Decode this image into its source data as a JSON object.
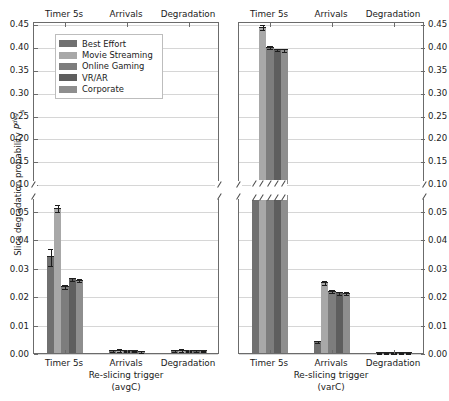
{
  "figure": {
    "ylabel_text": "Slice degradation probability",
    "ylabel_sym": "P",
    "ylabel_sub": "s",
    "ylabel_sup": "deg"
  },
  "legend": {
    "entries": [
      {
        "label": "Best Effort",
        "color": "#707070"
      },
      {
        "label": "Movie Streaming",
        "color": "#a8a8a8"
      },
      {
        "label": "Online Gaming",
        "color": "#7d7d7d"
      },
      {
        "label": "VR/AR",
        "color": "#5e5e5e"
      },
      {
        "label": "Corporate",
        "color": "#8e8e8e"
      }
    ]
  },
  "panels": [
    {
      "id": "avgC",
      "xlabel_line1": "Re-slicing trigger",
      "xlabel_line2": "(avgC)",
      "top_labels": [
        "Timer 5s",
        "Arrivals",
        "Degradation"
      ],
      "x_tick_labels": [
        "Timer 5s",
        "Arrivals",
        "Degradation"
      ],
      "y_ticks_upper": [
        "0.10",
        "0.15",
        "0.20",
        "0.25",
        "0.30",
        "0.35",
        "0.40",
        "0.45"
      ],
      "y_ticks_lower": [
        "0.00",
        "0.01",
        "0.02",
        "0.03",
        "0.04",
        "0.05"
      ],
      "y_side": "left"
    },
    {
      "id": "varC",
      "xlabel_line1": "Re-slicing trigger",
      "xlabel_line2": "(varC)",
      "top_labels": [
        "Timer 5s",
        "Arrivals",
        "Degradation"
      ],
      "x_tick_labels": [
        "Timer 5s",
        "Arrivals",
        "Degradation"
      ],
      "y_ticks_upper": [
        "0.10",
        "0.15",
        "0.20",
        "0.25",
        "0.30",
        "0.35",
        "0.40",
        "0.45"
      ],
      "y_ticks_lower": [
        "0.00",
        "0.01",
        "0.02",
        "0.03",
        "0.04",
        "0.05"
      ],
      "y_side": "right"
    }
  ],
  "chart_data": {
    "type": "bar",
    "title": "",
    "xlabel": "Re-slicing trigger",
    "ylabel": "Slice degradation probability P_s^deg",
    "grid": true,
    "legend_position": "upper-left",
    "broken_axis": {
      "lower_range": [
        0.0,
        0.055
      ],
      "upper_range": [
        0.1,
        0.45
      ]
    },
    "categories": [
      "Timer 5s",
      "Arrivals",
      "Degradation"
    ],
    "subplots": [
      {
        "name": "avgC",
        "series": [
          {
            "name": "Best Effort",
            "values": [
              0.034,
              0.001,
              0.001
            ],
            "errors": [
              0.003,
              0.0004,
              0.0004
            ]
          },
          {
            "name": "Movie Streaming",
            "values": [
              0.051,
              0.0012,
              0.0012
            ],
            "errors": [
              0.0012,
              0.0004,
              0.0004
            ]
          },
          {
            "name": "Online Gaming",
            "values": [
              0.0235,
              0.0009,
              0.0009
            ],
            "errors": [
              0.0008,
              0.0003,
              0.0003
            ]
          },
          {
            "name": "VR/AR",
            "values": [
              0.0262,
              0.0009,
              0.001
            ],
            "errors": [
              0.0006,
              0.0003,
              0.0003
            ]
          },
          {
            "name": "Corporate",
            "values": [
              0.0258,
              0.0008,
              0.0009
            ],
            "errors": [
              0.0006,
              0.0003,
              0.0003
            ]
          }
        ]
      },
      {
        "name": "varC",
        "series": [
          {
            "name": "Best Effort",
            "values": [
              0.105,
              0.0042,
              0.0002
            ],
            "errors": [
              0.006,
              0.0004,
              0.0001
            ]
          },
          {
            "name": "Movie Streaming",
            "values": [
              0.445,
              0.025,
              0.0002
            ],
            "errors": [
              0.0055,
              0.0008,
              0.0001
            ]
          },
          {
            "name": "Online Gaming",
            "values": [
              0.401,
              0.0219,
              0.0002
            ],
            "errors": [
              0.003,
              0.0006,
              0.0001
            ]
          },
          {
            "name": "VR/AR",
            "values": [
              0.396,
              0.0213,
              0.0002
            ],
            "errors": [
              0.003,
              0.0006,
              0.0001
            ]
          },
          {
            "name": "Corporate",
            "values": [
              0.3955,
              0.0212,
              0.0002
            ],
            "errors": [
              0.003,
              0.0006,
              0.0001
            ]
          }
        ]
      }
    ]
  }
}
